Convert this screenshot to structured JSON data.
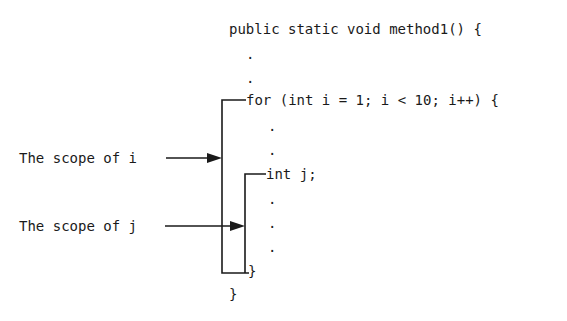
{
  "code": {
    "line1": "public static void method1() {",
    "dot": ".",
    "for_line": "for (int i = 1; i < 10; i++) {",
    "decl_j": "int j;",
    "close_inner": "}",
    "close_outer": "}"
  },
  "labels": {
    "scope_i": "The scope of i",
    "scope_j": "The scope of j"
  },
  "colors": {
    "ink": "#1a1a1a",
    "background": "#ffffff"
  }
}
